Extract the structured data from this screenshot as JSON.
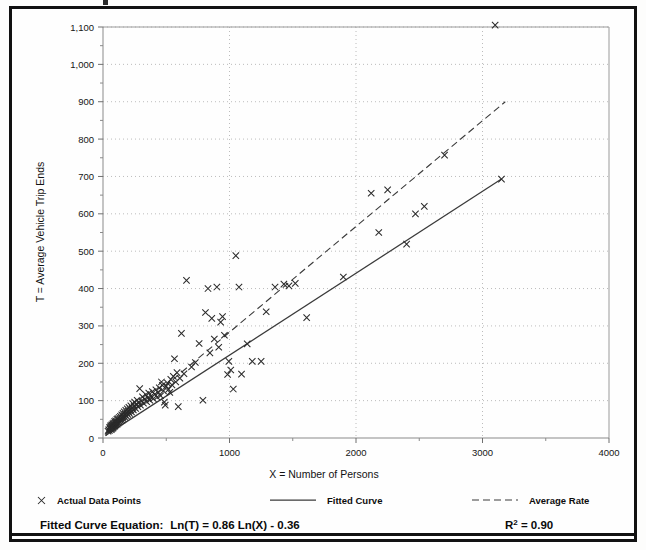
{
  "chart_data": {
    "type": "scatter",
    "title": "",
    "xlabel": "X = Number of Persons",
    "ylabel": "T = Average Vehicle Trip Ends",
    "xlim": [
      0,
      4000
    ],
    "ylim": [
      0,
      1100
    ],
    "x_major_ticks": [
      0,
      1000,
      2000,
      3000,
      4000
    ],
    "x_major_tick_labels": [
      "0",
      "1000",
      "2000",
      "3000",
      "4000"
    ],
    "x_minor_tick_step": 500,
    "y_major_ticks": [
      0,
      100,
      200,
      300,
      400,
      500,
      600,
      700,
      800,
      900,
      1000,
      1100
    ],
    "y_major_tick_labels": [
      "0",
      "100",
      "200",
      "300",
      "400",
      "500",
      "600",
      "700",
      "800",
      "900",
      "1,000",
      "1,100"
    ],
    "y_minor_tick_step": 50,
    "grid": true,
    "grid_style": "dotted",
    "legend_position": "below-axes",
    "marker_symbol": "x",
    "series": [
      {
        "name": "Actual Data Points",
        "type": "scatter",
        "marker": "x",
        "points": [
          [
            40,
            18
          ],
          [
            45,
            22
          ],
          [
            50,
            20
          ],
          [
            52,
            28
          ],
          [
            55,
            24
          ],
          [
            58,
            30
          ],
          [
            60,
            26
          ],
          [
            62,
            33
          ],
          [
            65,
            22
          ],
          [
            68,
            29
          ],
          [
            70,
            35
          ],
          [
            72,
            25
          ],
          [
            75,
            31
          ],
          [
            78,
            38
          ],
          [
            80,
            27
          ],
          [
            82,
            34
          ],
          [
            85,
            40
          ],
          [
            88,
            30
          ],
          [
            90,
            36
          ],
          [
            92,
            44
          ],
          [
            95,
            32
          ],
          [
            98,
            39
          ],
          [
            100,
            46
          ],
          [
            103,
            35
          ],
          [
            106,
            42
          ],
          [
            110,
            50
          ],
          [
            112,
            37
          ],
          [
            115,
            44
          ],
          [
            118,
            52
          ],
          [
            120,
            40
          ],
          [
            124,
            47
          ],
          [
            128,
            55
          ],
          [
            130,
            43
          ],
          [
            134,
            50
          ],
          [
            138,
            58
          ],
          [
            140,
            46
          ],
          [
            145,
            54
          ],
          [
            148,
            62
          ],
          [
            150,
            48
          ],
          [
            155,
            57
          ],
          [
            158,
            66
          ],
          [
            160,
            52
          ],
          [
            165,
            60
          ],
          [
            168,
            70
          ],
          [
            172,
            56
          ],
          [
            175,
            64
          ],
          [
            180,
            74
          ],
          [
            185,
            59
          ],
          [
            188,
            68
          ],
          [
            192,
            78
          ],
          [
            196,
            63
          ],
          [
            200,
            72
          ],
          [
            205,
            82
          ],
          [
            210,
            66
          ],
          [
            215,
            76
          ],
          [
            220,
            86
          ],
          [
            225,
            70
          ],
          [
            230,
            80
          ],
          [
            235,
            92
          ],
          [
            240,
            75
          ],
          [
            246,
            85
          ],
          [
            250,
            96
          ],
          [
            258,
            79
          ],
          [
            264,
            90
          ],
          [
            270,
            101
          ],
          [
            276,
            84
          ],
          [
            284,
            95
          ],
          [
            290,
            132
          ],
          [
            296,
            88
          ],
          [
            305,
            99
          ],
          [
            312,
            110
          ],
          [
            320,
            93
          ],
          [
            330,
            104
          ],
          [
            338,
            116
          ],
          [
            345,
            97
          ],
          [
            355,
            108
          ],
          [
            362,
            120
          ],
          [
            370,
            101
          ],
          [
            380,
            112
          ],
          [
            390,
            124
          ],
          [
            398,
            105
          ],
          [
            410,
            117
          ],
          [
            418,
            129
          ],
          [
            428,
            109
          ],
          [
            438,
            121
          ],
          [
            445,
            134
          ],
          [
            455,
            113
          ],
          [
            462,
            150
          ],
          [
            470,
            141
          ],
          [
            478,
            126
          ],
          [
            485,
            96
          ],
          [
            492,
            88
          ],
          [
            500,
            139
          ],
          [
            510,
            147
          ],
          [
            518,
            130
          ],
          [
            528,
            122
          ],
          [
            536,
            157
          ],
          [
            545,
            142
          ],
          [
            556,
            165
          ],
          [
            565,
            212
          ],
          [
            575,
            150
          ],
          [
            585,
            175
          ],
          [
            595,
            84
          ],
          [
            608,
            160
          ],
          [
            620,
            280
          ],
          [
            640,
            172
          ],
          [
            660,
            422
          ],
          [
            700,
            190
          ],
          [
            730,
            202
          ],
          [
            760,
            253
          ],
          [
            790,
            101
          ],
          [
            810,
            336
          ],
          [
            830,
            400
          ],
          [
            845,
            228
          ],
          [
            860,
            320
          ],
          [
            880,
            265
          ],
          [
            900,
            404
          ],
          [
            915,
            243
          ],
          [
            930,
            310
          ],
          [
            945,
            325
          ],
          [
            960,
            275
          ],
          [
            985,
            170
          ],
          [
            995,
            205
          ],
          [
            1010,
            182
          ],
          [
            1030,
            131
          ],
          [
            1050,
            488
          ],
          [
            1075,
            404
          ],
          [
            1095,
            171
          ],
          [
            1140,
            252
          ],
          [
            1180,
            205
          ],
          [
            1250,
            205
          ],
          [
            1290,
            338
          ],
          [
            1360,
            404
          ],
          [
            1430,
            412
          ],
          [
            1470,
            407
          ],
          [
            1520,
            414
          ],
          [
            1610,
            322
          ],
          [
            1900,
            431
          ],
          [
            2120,
            655
          ],
          [
            2180,
            550
          ],
          [
            2250,
            664
          ],
          [
            2400,
            519
          ],
          [
            2470,
            600
          ],
          [
            2540,
            620
          ],
          [
            2700,
            757
          ],
          [
            3100,
            1105
          ],
          [
            3150,
            693
          ]
        ]
      },
      {
        "name": "Fitted Curve",
        "type": "line",
        "style": "solid",
        "equation": "Ln(T) = 0.86 Ln(X) - 0.36",
        "points": [
          [
            20,
            7
          ],
          [
            3150,
            693
          ]
        ]
      },
      {
        "name": "Average Rate",
        "type": "line",
        "style": "dashed",
        "points": [
          [
            20,
            6
          ],
          [
            3180,
            900
          ]
        ]
      }
    ],
    "annotations": {
      "equation_label": "Fitted Curve Equation:",
      "equation": "Ln(T) = 0.86 Ln(X) - 0.36",
      "r_squared_base": "R",
      "r_squared_sup": "2",
      "r_squared_value": " = 0.90"
    }
  },
  "legend": {
    "items": [
      {
        "label": "Actual Data Points",
        "marker": "x-marker-icon"
      },
      {
        "label": "Fitted Curve",
        "marker": "solid-line-icon"
      },
      {
        "label": "Average Rate",
        "marker": "dashed-line-icon"
      }
    ]
  }
}
